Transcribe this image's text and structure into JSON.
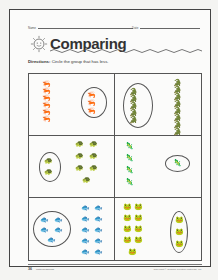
{
  "worksheet": {
    "name_label": "Name",
    "date_label": "Date",
    "title": "Comparing",
    "directions_label": "Directions:",
    "directions_text": " Circle the group that has less."
  },
  "panels": [
    {
      "animal": "shrimp",
      "left_count": 6,
      "right_count": 3,
      "circled": "right"
    },
    {
      "animal": "alligator",
      "left_count": 5,
      "right_count": 8,
      "circled": "left"
    },
    {
      "animal": "turtle",
      "left_count": 2,
      "right_count": 7,
      "circled": "left"
    },
    {
      "animal": "lizard",
      "left_count": 4,
      "right_count": 1,
      "circled": "right"
    },
    {
      "animal": "fish",
      "left_count": 5,
      "right_count": 10,
      "circled": "left"
    },
    {
      "animal": "frog",
      "left_count": 9,
      "right_count": 3,
      "circled": "right"
    }
  ],
  "footer": {
    "page_number": "36",
    "source": "Math Readiness",
    "copyright": "Copyright © Teacher Created Materials, Inc."
  }
}
